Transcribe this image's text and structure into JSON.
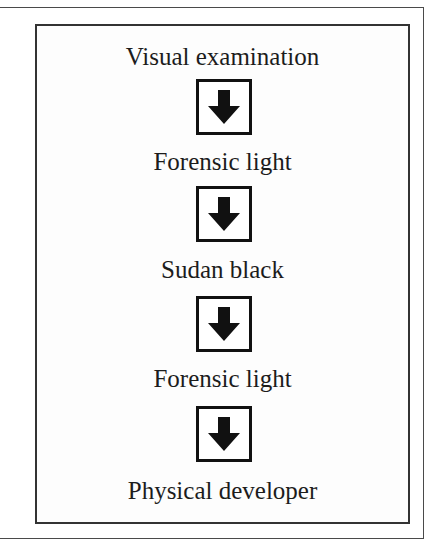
{
  "diagram": {
    "type": "vertical-flowchart",
    "steps": [
      {
        "label": "Visual examination"
      },
      {
        "label": "Forensic light"
      },
      {
        "label": "Sudan black"
      },
      {
        "label": "Forensic light"
      },
      {
        "label": "Physical developer"
      }
    ],
    "connectors": [
      {
        "icon": "down-arrow-icon",
        "from": 0,
        "to": 1
      },
      {
        "icon": "down-arrow-icon",
        "from": 1,
        "to": 2
      },
      {
        "icon": "down-arrow-icon",
        "from": 2,
        "to": 3
      },
      {
        "icon": "down-arrow-icon",
        "from": 3,
        "to": 4
      }
    ],
    "colors": {
      "text": "#1c1c1c",
      "arrow": "#111111",
      "border": "#333333",
      "background": "#ffffff"
    }
  }
}
